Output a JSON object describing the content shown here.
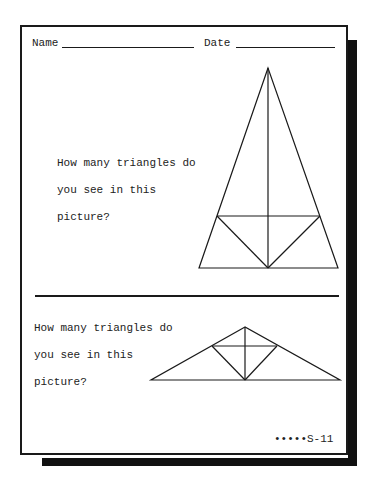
{
  "worksheet": {
    "header": {
      "name_label": "Name",
      "date_label": "Date"
    },
    "problems": [
      {
        "question_lines": [
          "How many triangles do",
          "you see in this",
          "picture?"
        ],
        "figure": "tall-isosceles-triangle-with-inner-lines"
      },
      {
        "question_lines": [
          "How many triangles do",
          "you see in this",
          "picture?"
        ],
        "figure": "wide-triangle-with-inner-diamond"
      }
    ],
    "footer": {
      "page_code": "•••••S-11"
    }
  }
}
